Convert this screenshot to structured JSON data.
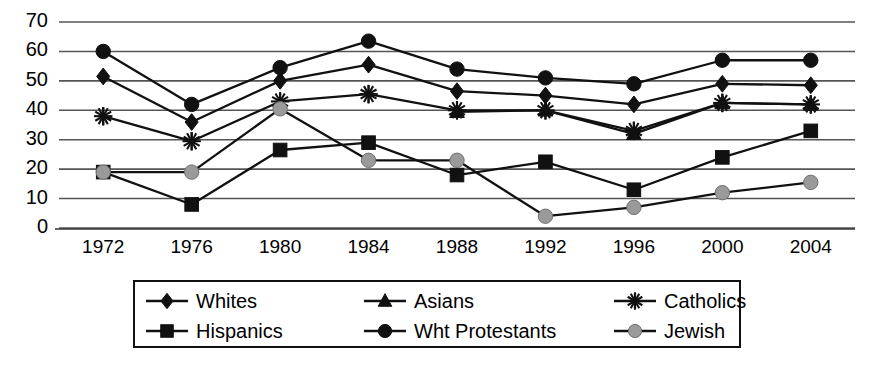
{
  "chart_data": {
    "type": "line",
    "title": "",
    "subtitle": "",
    "xlabel": "",
    "ylabel": "",
    "categories": [
      "1972",
      "1976",
      "1980",
      "1984",
      "1988",
      "1992",
      "1996",
      "2000",
      "2004"
    ],
    "ytick_labels": [
      "0",
      "10",
      "20",
      "30",
      "40",
      "50",
      "60",
      "70"
    ],
    "ytick_values": [
      0,
      10,
      20,
      30,
      40,
      50,
      60,
      70
    ],
    "ylim": [
      0,
      70
    ],
    "grid": "horizontal",
    "legend_position": "bottom",
    "series": [
      {
        "name": "Whites",
        "marker": "diamond",
        "color": "#111111",
        "values": [
          51.5,
          36,
          50,
          55.5,
          46.5,
          45,
          42,
          49,
          48.5
        ]
      },
      {
        "name": "Hispanics",
        "marker": "square",
        "color": "#111111",
        "values": [
          19,
          8,
          26.5,
          29,
          18,
          22.5,
          13,
          24,
          33
        ]
      },
      {
        "name": "Asians",
        "marker": "triangle",
        "color": "#111111",
        "values": [
          null,
          null,
          null,
          null,
          39.5,
          40,
          32,
          42.5,
          42
        ]
      },
      {
        "name": "Wht Protestants",
        "marker": "circle",
        "color": "#111111",
        "values": [
          60,
          42,
          54.5,
          63.5,
          54,
          51,
          49,
          57,
          57
        ]
      },
      {
        "name": "Catholics",
        "marker": "asterisk",
        "color": "#111111",
        "values": [
          38,
          29.5,
          43,
          45.5,
          40,
          40,
          33,
          42.5,
          42
        ]
      },
      {
        "name": "Jewish",
        "marker": "circle-gray",
        "color": "#9a9a9a",
        "values": [
          19,
          19,
          40.5,
          23,
          23,
          4,
          7,
          12,
          15.5
        ]
      }
    ]
  },
  "legend": {
    "items": [
      {
        "label": "Whites",
        "marker": "diamond"
      },
      {
        "label": "Asians",
        "marker": "triangle"
      },
      {
        "label": "Catholics",
        "marker": "asterisk"
      },
      {
        "label": "Hispanics",
        "marker": "square"
      },
      {
        "label": "Wht Protestants",
        "marker": "circle"
      },
      {
        "label": "Jewish",
        "marker": "circle-gray"
      }
    ]
  },
  "colors": {
    "line": "#111111",
    "grid": "#555555",
    "jewish_marker": "#9a9a9a",
    "background": "#ffffff"
  }
}
